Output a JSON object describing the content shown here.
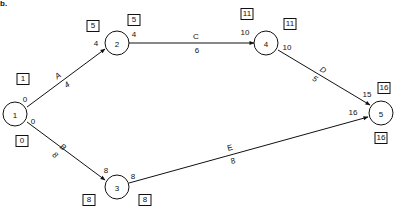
{
  "figure_label": "b.",
  "nodes": [
    {
      "id": "1",
      "label": "1",
      "box_top": "1",
      "box_bottom": "0"
    },
    {
      "id": "2",
      "label": "2",
      "box_left": "5",
      "box_right": "5"
    },
    {
      "id": "3",
      "label": "3",
      "box_left": "8",
      "box_right": "8"
    },
    {
      "id": "4",
      "label": "4",
      "box_left": "11",
      "box_right": "11"
    },
    {
      "id": "5",
      "label": "5",
      "box_top": "16",
      "box_bottom": "16"
    }
  ],
  "edges": [
    {
      "from": "1",
      "to": "2",
      "activity": "A",
      "duration": "4",
      "start_time": "0",
      "end_time": "4"
    },
    {
      "from": "1",
      "to": "3",
      "activity": "B",
      "duration": "8",
      "start_time": "0",
      "end_time": "8"
    },
    {
      "from": "2",
      "to": "4",
      "activity": "C",
      "duration": "6",
      "start_time": "4",
      "end_time": "10"
    },
    {
      "from": "4",
      "to": "5",
      "activity": "D",
      "duration": "5",
      "start_time": "10",
      "end_time": "15"
    },
    {
      "from": "3",
      "to": "5",
      "activity": "E",
      "duration": "8",
      "start_time": "8",
      "end_time": "16"
    }
  ]
}
